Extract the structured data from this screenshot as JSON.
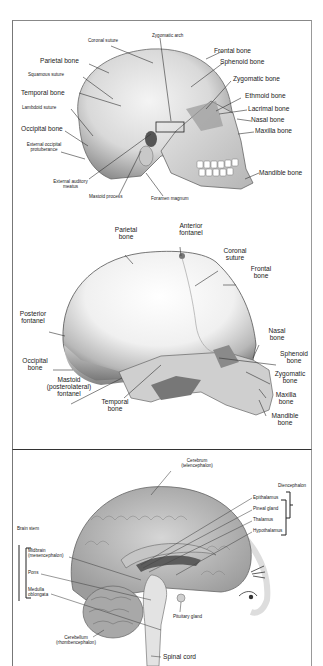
{
  "panels": {
    "adult_skull": {
      "labels": {
        "coronal_suture": "Coronal suture",
        "zygomatic_arch": "Zygomatic arch",
        "frontal_bone": "Frontal bone",
        "parietal_bone": "Parietal bone",
        "sphenoid_bone": "Sphenoid bone",
        "squamous_suture": "Squamous suture",
        "zygomatic_bone": "Zygomatic bone",
        "temporal_bone": "Temporal bone",
        "ethmoid_bone": "Ethmoid bone",
        "lambdoid_suture": "Lambdoid suture",
        "lacrimal_bone": "Lacrimal bone",
        "nasal_bone": "Nasal bone",
        "occipital_bone": "Occipital bone",
        "maxilla_bone": "Maxilla bone",
        "external_occipital_1": "External occipital",
        "external_occipital_2": "protuberance",
        "mandible_bone": "Mandible bone",
        "external_auditory_1": "External auditory",
        "external_auditory_2": "meatus",
        "mastoid_process": "Mastoid process",
        "foramen_magnum": "Foramen magnum"
      }
    },
    "infant_skull": {
      "labels": {
        "parietal_1": "Parietal",
        "parietal_2": "bone",
        "anterior_fontanel_1": "Anterior",
        "anterior_fontanel_2": "fontanel",
        "coronal_1": "Coronal",
        "coronal_2": "suture",
        "frontal_1": "Frontal",
        "frontal_2": "bone",
        "posterior_fontanel_1": "Posterior",
        "posterior_fontanel_2": "fontanel",
        "nasal_1": "Nasal",
        "nasal_2": "bone",
        "occipital_1": "Occipital",
        "occipital_2": "bone",
        "sphenoid_1": "Sphenoid",
        "sphenoid_2": "bone",
        "mastoid_1": "Mastoid",
        "mastoid_2": "(posterolateral)",
        "mastoid_3": "fontanel",
        "zygomatic_1": "Zygomatic",
        "zygomatic_2": "bone",
        "temporal_1": "Temporal",
        "temporal_2": "bone",
        "maxilla_1": "Maxilla",
        "maxilla_2": "bone",
        "mandible_1": "Mandible",
        "mandible_2": "bone"
      }
    },
    "brain": {
      "labels": {
        "cerebrum_1": "Cerebrum",
        "cerebrum_2": "(telencephalon)",
        "diencephalon": "Diencephalon",
        "epithalamus": "Epithalamus",
        "pineal_gland": "Pineal gland",
        "thalamus": "Thalamus",
        "hypothalamus": "Hypothalamus",
        "brain_stem": "Brain stem",
        "midbrain_1": "Midbrain",
        "midbrain_2": "(mesencephalon)",
        "pons": "Pons",
        "medulla_1": "Medulla",
        "medulla_2": "oblongata",
        "pituitary_gland": "Pituitary gland",
        "cerebellum_1": "Cerebellum",
        "cerebellum_2": "(rhombencephalon)",
        "spinal_cord": "Spinal cord"
      }
    }
  }
}
